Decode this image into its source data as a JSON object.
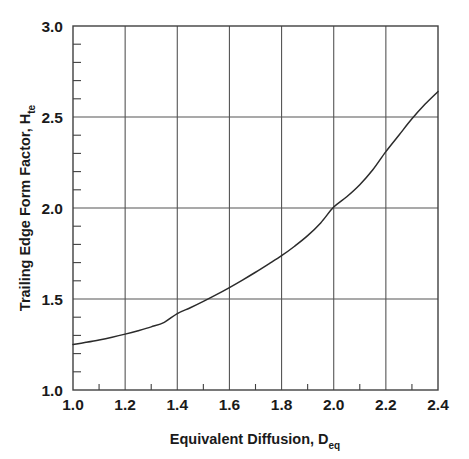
{
  "chart_data": {
    "type": "line",
    "title": "",
    "xlabel": "Equivalent Diffusion, D",
    "xlabel_sub": "eq",
    "ylabel": "Trailing Edge Form Factor, H",
    "ylabel_sub": "te",
    "xlim": [
      1.0,
      2.4
    ],
    "ylim": [
      1.0,
      3.0
    ],
    "grid": true,
    "legend": null,
    "x_ticks": [
      "1.0",
      "1.2",
      "1.4",
      "1.6",
      "1.8",
      "2.0",
      "2.2",
      "2.4"
    ],
    "x_tick_values": [
      1.0,
      1.2,
      1.4,
      1.6,
      1.8,
      2.0,
      2.2,
      2.4
    ],
    "x_minor_step": 0.1,
    "y_ticks": [
      "1.0",
      "1.5",
      "2.0",
      "2.5",
      "3.0"
    ],
    "y_tick_values": [
      1.0,
      1.5,
      2.0,
      2.5,
      3.0
    ],
    "y_minor_step": 0.1,
    "line_color": "#2b2b2b",
    "axis_color": "#404040",
    "grid_color": "#555555",
    "series": [
      {
        "name": "Trailing Edge Form Factor",
        "x": [
          1.0,
          1.05,
          1.1,
          1.15,
          1.2,
          1.25,
          1.3,
          1.35,
          1.4,
          1.45,
          1.5,
          1.55,
          1.6,
          1.65,
          1.7,
          1.75,
          1.8,
          1.85,
          1.9,
          1.95,
          2.0,
          2.05,
          2.1,
          2.15,
          2.2,
          2.25,
          2.3,
          2.35,
          2.4
        ],
        "values": [
          1.25,
          1.262,
          1.275,
          1.29,
          1.307,
          1.326,
          1.347,
          1.372,
          1.42,
          1.452,
          1.487,
          1.524,
          1.563,
          1.604,
          1.647,
          1.692,
          1.738,
          1.79,
          1.848,
          1.918,
          2.005,
          2.062,
          2.128,
          2.21,
          2.31,
          2.4,
          2.49,
          2.57,
          2.64
        ]
      }
    ]
  },
  "axis_labels": {
    "x_title_main": "Equivalent Diffusion, D",
    "x_title_sub": "eq",
    "y_title_main": "Trailing Edge Form Factor, H",
    "y_title_sub": "te"
  }
}
